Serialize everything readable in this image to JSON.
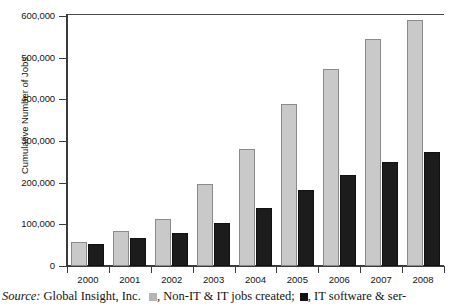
{
  "chart_data": {
    "type": "bar",
    "title": "",
    "subtitle": "",
    "xlabel": "",
    "ylabel": "Cumulative Number of Jobs",
    "categories": [
      "2000",
      "2001",
      "2002",
      "2003",
      "2004",
      "2005",
      "2006",
      "2007",
      "2008"
    ],
    "series": [
      {
        "name": "Non-IT & IT jobs created",
        "color": "#c9c9c9",
        "values": [
          57000,
          85000,
          113000,
          198000,
          280000,
          388000,
          474000,
          545000,
          590000
        ]
      },
      {
        "name": "IT software & services jobs created",
        "color": "#1c1c1c",
        "values": [
          52000,
          68000,
          80000,
          104000,
          140000,
          182000,
          219000,
          250000,
          274000
        ]
      }
    ],
    "ylim": [
      0,
      600000
    ],
    "yticks": [
      0,
      100000,
      200000,
      300000,
      400000,
      500000,
      600000
    ],
    "ytick_labels": [
      "0",
      "100,000",
      "200,000",
      "300,000",
      "400,000",
      "500,000",
      "600,000"
    ],
    "grid": false,
    "legend_position": "caption-below"
  },
  "caption": {
    "source_word": "Source:",
    "source_text": "Global Insight, Inc.",
    "legend_light_text": ", Non-IT & IT jobs created;",
    "legend_dark_text": ", IT software & ser-"
  }
}
